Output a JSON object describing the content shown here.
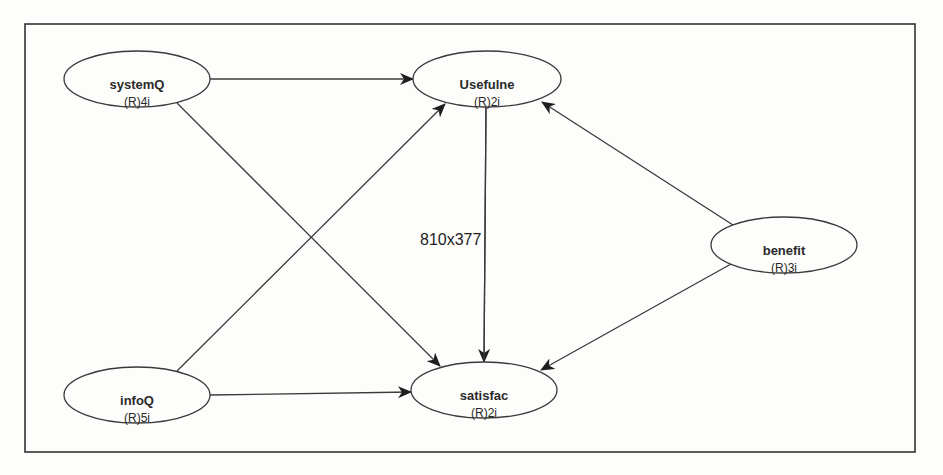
{
  "diagram": {
    "type": "path-model",
    "frame": {
      "x": 25,
      "y": 24,
      "width": 890,
      "height": 428,
      "stroke": "#333333"
    },
    "size_label": {
      "text": "810x377",
      "x": 420,
      "y": 245
    },
    "colors": {
      "background": "#fdfdfb",
      "stroke": "#3a3a3a",
      "text": "#2a2a2a",
      "node_fill": "#fdfdfb"
    },
    "nodes": [
      {
        "id": "systemQ",
        "label": "systemQ",
        "sub": "(R)4i",
        "cx": 137,
        "cy": 79,
        "rx": 73,
        "ry": 28
      },
      {
        "id": "Usefulne",
        "label": "Usefulne",
        "sub": "(R)2i",
        "cx": 487,
        "cy": 79,
        "rx": 74,
        "ry": 28
      },
      {
        "id": "benefit",
        "label": "benefit",
        "sub": "(R)3i",
        "cx": 784,
        "cy": 245,
        "rx": 73,
        "ry": 28
      },
      {
        "id": "infoQ",
        "label": "infoQ",
        "sub": "(R)5i",
        "cx": 137,
        "cy": 395,
        "rx": 73,
        "ry": 28
      },
      {
        "id": "satisfac",
        "label": "satisfac",
        "sub": "(R)2i",
        "cx": 484,
        "cy": 390,
        "rx": 73,
        "ry": 28
      }
    ],
    "edges": [
      {
        "from": "systemQ",
        "to": "Usefulne",
        "x1": 210,
        "y1": 79,
        "x2": 413,
        "y2": 79
      },
      {
        "from": "systemQ",
        "to": "satisfac",
        "x1": 177,
        "y1": 103,
        "x2": 440,
        "y2": 366
      },
      {
        "from": "infoQ",
        "to": "Usefulne",
        "x1": 177,
        "y1": 371,
        "x2": 445,
        "y2": 104
      },
      {
        "from": "infoQ",
        "to": "satisfac",
        "x1": 210,
        "y1": 395,
        "x2": 411,
        "y2": 392
      },
      {
        "from": "Usefulne",
        "to": "satisfac",
        "x1": 486,
        "y1": 107,
        "x2": 484,
        "y2": 362
      },
      {
        "from": "benefit",
        "to": "Usefulne",
        "x1": 733,
        "y1": 225,
        "x2": 542,
        "y2": 102
      },
      {
        "from": "benefit",
        "to": "satisfac",
        "x1": 731,
        "y1": 264,
        "x2": 541,
        "y2": 370
      }
    ]
  }
}
